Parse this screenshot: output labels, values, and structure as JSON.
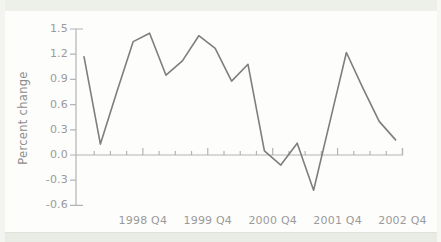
{
  "figure": {
    "title": "",
    "ylabel": "Percent change"
  },
  "chart_data": {
    "type": "line",
    "title": "",
    "xlabel": "",
    "ylabel": "Percent change",
    "ylim": [
      -0.6,
      1.5
    ],
    "y_tick_step": 0.3,
    "y_tick_labels": [
      "1.5",
      "1.2",
      "0.9",
      "0.6",
      "0.3",
      "0.0",
      "-0.3",
      "-0.6"
    ],
    "x_tick_labels": [
      "1998 Q4",
      "1999 Q4",
      "2000 Q4",
      "2001 Q4",
      "2002 Q4"
    ],
    "x_minor_ticks_per_year": 4,
    "grid": false,
    "legend": false,
    "categories": [
      "1998 Q1",
      "1998 Q2",
      "1998 Q3",
      "1998 Q4",
      "1999 Q1",
      "1999 Q2",
      "1999 Q3",
      "1999 Q4",
      "2000 Q1",
      "2000 Q2",
      "2000 Q3",
      "2000 Q4",
      "2001 Q1",
      "2001 Q2",
      "2001 Q3",
      "2001 Q4",
      "2002 Q1",
      "2002 Q2",
      "2002 Q3",
      "2002 Q4"
    ],
    "values": [
      1.17,
      0.13,
      0.75,
      1.35,
      1.45,
      0.95,
      1.12,
      1.42,
      1.27,
      0.88,
      1.08,
      0.05,
      -0.12,
      0.14,
      -0.42,
      0.4,
      1.22,
      0.8,
      0.4,
      0.18
    ],
    "line_color": "#7e7e7e",
    "axis_color": "#b4b4b4",
    "label_color": "#9a9a9a"
  }
}
